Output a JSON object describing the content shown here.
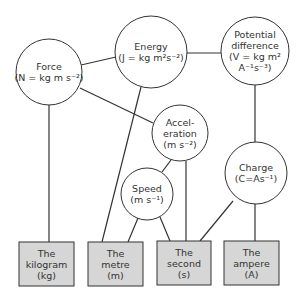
{
  "diagram": {
    "type": "concept-map",
    "colors": {
      "line": "#333333",
      "circle_fill": "#ffffff",
      "box_fill": "#d6d6d6",
      "text": "#333333"
    },
    "derived_units": [
      {
        "id": "force",
        "lines": [
          "Force",
          "(N = kg m s⁻²)"
        ],
        "cx": 49,
        "cy": 72,
        "r": 33
      },
      {
        "id": "energy",
        "lines": [
          "Energy",
          "(J = kg m²s⁻²)"
        ],
        "cx": 151,
        "cy": 52,
        "r": 36
      },
      {
        "id": "potential-difference",
        "lines": [
          "Potential",
          "difference",
          "(V = kg m²",
          "A⁻¹s⁻³)"
        ],
        "cx": 255,
        "cy": 51,
        "r": 34
      },
      {
        "id": "acceleration",
        "lines": [
          "Accel-",
          "eration",
          "(m s⁻²)"
        ],
        "cx": 180,
        "cy": 133,
        "r": 28
      },
      {
        "id": "speed",
        "lines": [
          "Speed",
          "(m s⁻¹)"
        ],
        "cx": 147,
        "cy": 194,
        "r": 26
      },
      {
        "id": "charge",
        "lines": [
          "Charge",
          "(C=As⁻¹)"
        ],
        "cx": 256,
        "cy": 173,
        "r": 31
      }
    ],
    "base_units": [
      {
        "id": "kilogram",
        "lines": [
          "The",
          "kilogram",
          "(kg)"
        ],
        "x": 19,
        "y": 242,
        "w": 55,
        "h": 44
      },
      {
        "id": "metre",
        "lines": [
          "The",
          "metre",
          "(m)"
        ],
        "x": 88,
        "y": 242,
        "w": 55,
        "h": 44
      },
      {
        "id": "second",
        "lines": [
          "The",
          "second",
          "(s)"
        ],
        "x": 157,
        "y": 241,
        "w": 54,
        "h": 44
      },
      {
        "id": "ampere",
        "lines": [
          "The",
          "ampere",
          "(A)"
        ],
        "x": 224,
        "y": 241,
        "w": 55,
        "h": 44
      }
    ],
    "connections": [
      {
        "from": "force",
        "to": "energy",
        "x1": 81,
        "y1": 65,
        "x2": 116,
        "y2": 57
      },
      {
        "from": "force",
        "to": "acceleration",
        "x1": 80,
        "y1": 88,
        "x2": 153,
        "y2": 123
      },
      {
        "from": "force",
        "to": "kilogram",
        "x1": 49,
        "y1": 105,
        "x2": 49,
        "y2": 242
      },
      {
        "from": "energy",
        "to": "metre",
        "x1": 141,
        "y1": 87,
        "x2": 102,
        "y2": 242
      },
      {
        "from": "energy",
        "to": "potential-difference",
        "x1": 187,
        "y1": 53,
        "x2": 221,
        "y2": 53
      },
      {
        "from": "potential-difference",
        "to": "charge",
        "x1": 255,
        "y1": 85,
        "x2": 255,
        "y2": 142
      },
      {
        "from": "acceleration",
        "to": "speed",
        "x1": 171,
        "y1": 160,
        "x2": 162,
        "y2": 172
      },
      {
        "from": "acceleration",
        "to": "second",
        "x1": 186,
        "y1": 161,
        "x2": 186,
        "y2": 241
      },
      {
        "from": "speed",
        "to": "metre",
        "x1": 138,
        "y1": 218,
        "x2": 128,
        "y2": 242
      },
      {
        "from": "speed",
        "to": "second",
        "x1": 160,
        "y1": 217,
        "x2": 170,
        "y2": 241
      },
      {
        "from": "charge",
        "to": "second",
        "x1": 233,
        "y1": 201,
        "x2": 200,
        "y2": 241
      },
      {
        "from": "charge",
        "to": "ampere",
        "x1": 255,
        "y1": 204,
        "x2": 255,
        "y2": 241
      }
    ]
  }
}
